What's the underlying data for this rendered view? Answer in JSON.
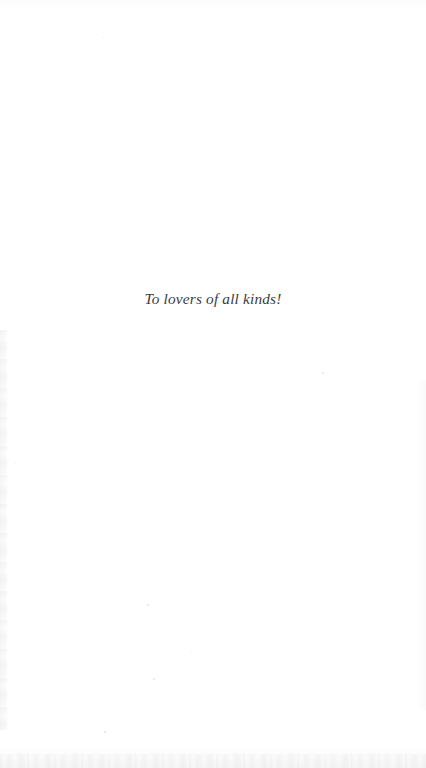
{
  "document": {
    "page_type": "dedication-page",
    "background_color": "#ffffff",
    "ink_color": "#3b3b3d"
  },
  "dedication": {
    "text": "To lovers of all kinds!"
  }
}
